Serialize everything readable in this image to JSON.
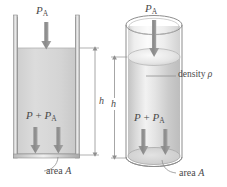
{
  "figure": {
    "background_color": "#ffffff",
    "line_color": "#6e6e6e",
    "label_color": "#4a4a4a",
    "fluid_color": "#d9d9d9",
    "width": 227,
    "height": 187
  },
  "left_diagram": {
    "name": "rectangular-container",
    "shape": "rectangular vessel",
    "top_pressure_label": {
      "symbol": "P",
      "subscript": "A",
      "text": "PA"
    },
    "bottom_pressure_label": {
      "symbol": "P",
      "operator": " + ",
      "symbol2": "P",
      "subscript2": "A",
      "text": "P + PA"
    },
    "height_label": "h",
    "area_label_prefix": "area ",
    "area_label_symbol": "A",
    "arrow_count_top": 1,
    "arrow_count_bottom": 2
  },
  "right_diagram": {
    "name": "cylindrical-container",
    "shape": "cylinder",
    "top_pressure_label": {
      "symbol": "P",
      "subscript": "A",
      "text": "PA"
    },
    "bottom_pressure_label": {
      "symbol": "P",
      "operator": " + ",
      "symbol2": "P",
      "subscript2": "A",
      "text": "P + PA"
    },
    "height_label": "h",
    "area_label_prefix": "area ",
    "area_label_symbol": "A",
    "density_label_prefix": "density ",
    "density_label_symbol": "ρ",
    "arrow_count_top": 1,
    "arrow_count_bottom": 2
  }
}
